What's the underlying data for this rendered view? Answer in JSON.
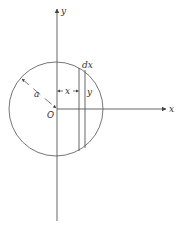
{
  "diagram": {
    "type": "geometry",
    "colors": {
      "stroke": "#555555",
      "text": "#333333",
      "background": "#ffffff"
    },
    "axes": {
      "x_label": "x",
      "y_label": "y",
      "origin_label": "O"
    },
    "circle": {
      "radius_label": "a"
    },
    "strip": {
      "width_label": "dx",
      "distance_label": "x",
      "height_label": "y"
    }
  }
}
